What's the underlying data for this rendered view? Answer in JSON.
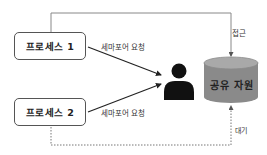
{
  "diagram": {
    "nodes": {
      "process1": {
        "label": "프로세스 1"
      },
      "process2": {
        "label": "프로세스 2"
      },
      "semaphore": {
        "icon": "person-icon"
      },
      "resource": {
        "label": "공유 자원",
        "shape": "cylinder"
      }
    },
    "edges": {
      "p1_request": {
        "from": "process1",
        "to": "semaphore",
        "label": "세마포어 요청",
        "style": "solid"
      },
      "p2_request": {
        "from": "process2",
        "to": "semaphore",
        "label": "세마포어 요청",
        "style": "solid"
      },
      "p1_access": {
        "from": "process1",
        "to": "resource",
        "label": "접근",
        "style": "solid"
      },
      "p2_wait": {
        "from": "process2",
        "to": "resource",
        "label": "대기",
        "style": "dotted"
      }
    },
    "colors": {
      "line": "#333333",
      "frame_line": "#888888",
      "cylinder_body": "#8a8a8a",
      "cylinder_top": "#a9a9a9",
      "icon": "#111111"
    }
  }
}
